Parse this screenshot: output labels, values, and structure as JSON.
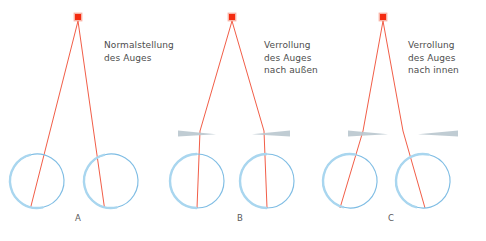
{
  "figure": {
    "background": "#ffffff",
    "colors": {
      "ray": "#ef4b32",
      "target": "#f42b10",
      "target_halo": "#f79b8a",
      "eye_outline": "#7fbde4",
      "cornea": "#a9d6ef",
      "prism": "#b9c6ce",
      "text": "#4d4d4d",
      "letter": "#59595b"
    }
  },
  "panels": [
    {
      "id": "a",
      "letter": "A",
      "caption": "Normalstellung\ndes Auges",
      "caption_lines": [
        "Normalstellung",
        "des Auges"
      ],
      "target": {
        "x": 78,
        "y": 17,
        "size": 7
      },
      "prisms": [],
      "eyes": [
        {
          "side": "left",
          "cx": 37,
          "cy": 181,
          "r": 27,
          "rotation_deg": -13
        },
        {
          "side": "right",
          "cx": 111,
          "cy": 181,
          "r": 27,
          "rotation_deg": -13
        }
      ],
      "rays": [
        {
          "from": [
            78,
            21
          ],
          "to": [
            30,
            208
          ]
        },
        {
          "from": [
            78,
            21
          ],
          "to": [
            104,
            208
          ]
        }
      ]
    },
    {
      "id": "b",
      "letter": "B",
      "caption": "Verrollung\ndes Auges\nnach außen",
      "caption_lines": [
        "Verrollung",
        "des Auges",
        "nach außen"
      ],
      "target": {
        "x": 232,
        "y": 17,
        "size": 7
      },
      "prisms": [
        {
          "side": "left",
          "x": 178,
          "y": 133,
          "width": 38,
          "orientation": "apex-inward"
        },
        {
          "side": "right",
          "x": 252,
          "y": 133,
          "width": 38,
          "orientation": "apex-inward"
        }
      ],
      "eyes": [
        {
          "side": "left",
          "cx": 197,
          "cy": 181,
          "r": 27,
          "rotation_deg": 0
        },
        {
          "side": "right",
          "cx": 267,
          "cy": 181,
          "r": 27,
          "rotation_deg": 0
        }
      ],
      "rays": [
        {
          "from": [
            232,
            21
          ],
          "to": [
            197,
            208
          ]
        },
        {
          "from": [
            232,
            21
          ],
          "to": [
            267,
            208
          ]
        }
      ]
    },
    {
      "id": "c",
      "letter": "C",
      "caption": "Verrollung\ndes Auges\nnach innen",
      "caption_lines": [
        "Verrollung",
        "des Auges",
        "nach innen"
      ],
      "target": {
        "x": 383,
        "y": 17,
        "size": 7
      },
      "prisms": [
        {
          "side": "left",
          "x": 348,
          "y": 133,
          "width": 40,
          "orientation": "apex-outward"
        },
        {
          "side": "right",
          "x": 385,
          "y": 133,
          "width": 40,
          "orientation": "apex-outward"
        }
      ],
      "eyes": [
        {
          "side": "left",
          "cx": 350,
          "cy": 181,
          "r": 27,
          "rotation_deg": 13
        },
        {
          "side": "right",
          "cx": 423,
          "cy": 181,
          "r": 27,
          "rotation_deg": 13
        }
      ],
      "rays": [
        {
          "from": [
            383,
            21
          ],
          "to": [
            340,
            208
          ]
        },
        {
          "from": [
            383,
            21
          ],
          "to": [
            414,
            208
          ]
        }
      ]
    }
  ]
}
